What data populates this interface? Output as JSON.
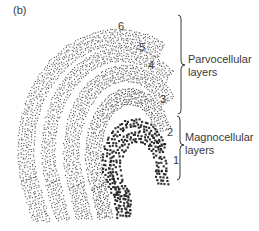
{
  "figure": {
    "panel_label": "(b)",
    "layers": [
      {
        "id": 6,
        "label": "6",
        "type": "parvocellular",
        "label_pos": [
          118,
          20
        ]
      },
      {
        "id": 5,
        "label": "5",
        "type": "parvocellular",
        "label_pos": [
          139,
          41
        ]
      },
      {
        "id": 4,
        "label": "4",
        "type": "parvocellular",
        "label_pos": [
          148,
          59
        ]
      },
      {
        "id": 3,
        "label": "3",
        "type": "parvocellular",
        "label_pos": [
          160,
          93
        ]
      },
      {
        "id": 2,
        "label": "2",
        "type": "magnocellular",
        "label_pos": [
          167,
          126
        ]
      },
      {
        "id": 1,
        "label": "1",
        "type": "magnocellular",
        "label_pos": [
          173,
          154
        ]
      }
    ],
    "groups": [
      {
        "name": "Parvocellular",
        "line1": "Parvocellular",
        "line2": "layers",
        "brace": {
          "x": 181,
          "y1": 15,
          "y2": 114,
          "tip": 65
        }
      },
      {
        "name": "Magnocellular",
        "line1": "Magnocellular",
        "line2": "layers",
        "brace": {
          "x": 180,
          "y1": 116,
          "y2": 180,
          "tip": 145
        }
      }
    ],
    "colors": {
      "ink": "#3a3a3a",
      "small_dots": "#555555",
      "large_dots": "#2b2b2b"
    }
  }
}
